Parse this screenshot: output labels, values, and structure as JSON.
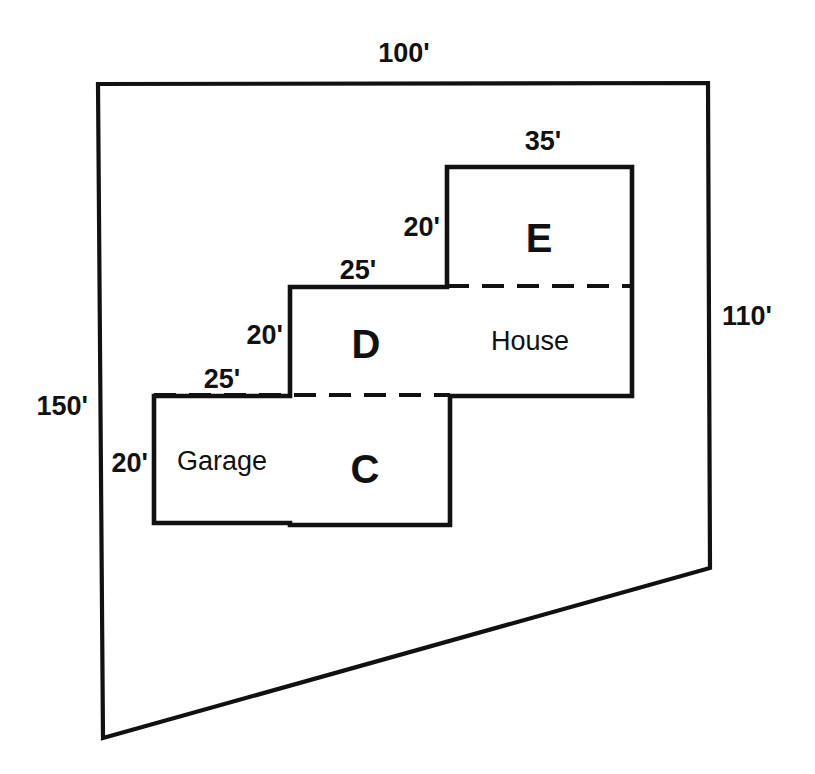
{
  "diagram": {
    "units": "feet",
    "stroke_color": "#111111",
    "background_color": "#ffffff",
    "lot": {
      "name": "property-boundary",
      "shape": "quadrilateral",
      "dimensions": {
        "top": "100'",
        "right": "110'",
        "left": "150'"
      }
    },
    "dimension_labels": [
      {
        "id": "lot-top",
        "text": "100'",
        "x": 404,
        "y": 62,
        "anchor": "middle"
      },
      {
        "id": "lot-right",
        "text": "110'",
        "x": 722,
        "y": 325,
        "anchor": "start"
      },
      {
        "id": "lot-left",
        "text": "150'",
        "x": 88,
        "y": 415,
        "anchor": "end"
      },
      {
        "id": "e-top",
        "text": "35'",
        "x": 543,
        "y": 150,
        "anchor": "middle"
      },
      {
        "id": "e-left",
        "text": "20'",
        "x": 440,
        "y": 236,
        "anchor": "end"
      },
      {
        "id": "d-top",
        "text": "25'",
        "x": 358,
        "y": 279,
        "anchor": "middle"
      },
      {
        "id": "d-left",
        "text": "20'",
        "x": 283,
        "y": 344,
        "anchor": "end"
      },
      {
        "id": "garage-top",
        "text": "25'",
        "x": 222,
        "y": 388,
        "anchor": "middle"
      },
      {
        "id": "garage-left",
        "text": "20'",
        "x": 148,
        "y": 472,
        "anchor": "end"
      }
    ],
    "zone_labels": [
      {
        "id": "zone-e",
        "text": "E",
        "x": 539,
        "y": 252,
        "anchor": "middle"
      },
      {
        "id": "zone-d",
        "text": "D",
        "x": 366,
        "y": 358,
        "anchor": "middle"
      },
      {
        "id": "zone-c",
        "text": "C",
        "x": 365,
        "y": 483,
        "anchor": "middle"
      }
    ],
    "room_labels": [
      {
        "id": "room-house",
        "text": "House",
        "x": 530,
        "y": 350,
        "anchor": "middle"
      },
      {
        "id": "room-garage",
        "text": "Garage",
        "x": 222,
        "y": 470,
        "anchor": "middle"
      }
    ],
    "geometry": {
      "lot_outline_points": "98,84 708,83 710,568 103,738 98,84",
      "structure_outline_points": "447,167 632,167 632,396 450,396 450,525 290,525 290,523 154,523 154,396 290,396 290,287 447,287 447,167",
      "divider_e_house": "447,286 632,286",
      "divider_d_c": "154,395 450,395"
    },
    "regions": [
      {
        "id": "E",
        "label": "E",
        "x": 447,
        "y": 167,
        "width": 185,
        "height": 119
      },
      {
        "id": "House",
        "label": "House",
        "x": 447,
        "y": 286,
        "width": 185,
        "height": 110
      },
      {
        "id": "D",
        "label": "D",
        "x": 290,
        "y": 287,
        "width": 157,
        "height": 108
      },
      {
        "id": "C",
        "label": "C",
        "x": 290,
        "y": 395,
        "width": 160,
        "height": 130
      },
      {
        "id": "Garage",
        "label": "Garage",
        "x": 154,
        "y": 396,
        "width": 136,
        "height": 127
      }
    ]
  }
}
